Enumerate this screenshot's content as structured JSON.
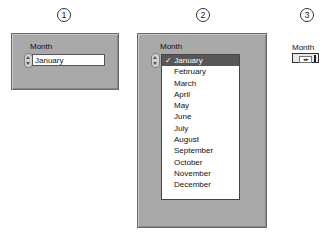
{
  "step_markers": [
    "1",
    "2",
    "3"
  ],
  "panel1": {
    "label": "Month",
    "value": "January"
  },
  "panel2": {
    "label": "Month",
    "check_glyph": "✓",
    "selected": "January",
    "options": [
      "January",
      "February",
      "March",
      "April",
      "May",
      "June",
      "July",
      "August",
      "September",
      "October",
      "November",
      "December"
    ]
  },
  "panel3": {
    "label": "Month",
    "indicator": "◂▸"
  },
  "colors": {
    "panel_bg": "#a9a9a9",
    "selected_bg": "#575757"
  }
}
